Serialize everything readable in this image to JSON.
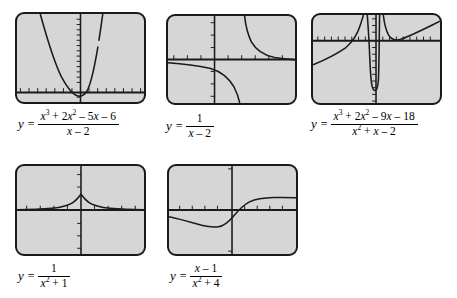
{
  "figure": {
    "kind": "graphing-calculator-screens-figure",
    "background_color": "#ffffff",
    "screen_fill": "#d6d6d6",
    "curve_color": "#1a1a1a",
    "axis_color": "#1a1a1a",
    "panel_count": 5
  },
  "panels": [
    {
      "id": "panel-1",
      "equation_text": "y = (x^3 + 2x^2 - 5x - 6)/(x - 2)",
      "numerator": {
        "parts": [
          {
            "t": "x",
            "italic": true
          },
          {
            "t": "3",
            "sup": true
          },
          {
            "t": " + 2"
          },
          {
            "t": "x",
            "italic": true
          },
          {
            "t": "2",
            "sup": true
          },
          {
            "t": " – 5"
          },
          {
            "t": "x",
            "italic": true
          },
          {
            "t": " – 6"
          }
        ],
        "plain": "x3 + 2x2 – 5x – 6"
      },
      "denominator": {
        "plain": "x – 2"
      },
      "y_label": "y",
      "equals": "=",
      "chart": {
        "type": "line",
        "function": "(x^3 + 2x^2 - 5x - 6)/(x - 2)",
        "hole_at_x": 3,
        "xlim": [
          -9.4,
          9.4
        ],
        "ylim": [
          -3.1,
          28
        ],
        "x_tick_step": 1,
        "y_tick_step": 2,
        "grid": false,
        "axis_x_position_frac": 0.895,
        "axis_y_position_frac": 0.5
      }
    },
    {
      "id": "panel-2",
      "equation_text": "y = 1/(x - 2)",
      "numerator": {
        "plain": "1"
      },
      "denominator": {
        "plain": "x – 2"
      },
      "y_label": "y",
      "equals": "=",
      "chart": {
        "type": "line",
        "function": "1/(x - 2)",
        "vertical_asymptotes": [
          2
        ],
        "horizontal_asymptote": 0,
        "xlim": [
          -4.7,
          4.7
        ],
        "ylim": [
          -3.1,
          3.1
        ],
        "x_tick_step": 1,
        "y_tick_step": 1,
        "grid": false,
        "axis_x_position_frac": 0.5,
        "axis_y_position_frac": 0.5
      }
    },
    {
      "id": "panel-3",
      "equation_text": "y = (x^3 + 2x^2 - 9x - 18)/(x^2 + x - 2)",
      "numerator": {
        "plain": "x3 + 2x2 – 9x – 18"
      },
      "denominator": {
        "plain": "x2 + x – 2"
      },
      "y_label": "y",
      "equals": "=",
      "chart": {
        "type": "line",
        "function": "(x^3 + 2x^2 - 9x - 18)/(x^2 + x - 2)",
        "vertical_asymptotes": [
          -2,
          1
        ],
        "slant_asymptote": "y = x + 1",
        "xlim": [
          -9.4,
          9.4
        ],
        "ylim": [
          -18,
          10
        ],
        "x_tick_step": 1,
        "y_tick_step": 1,
        "grid": false,
        "axis_x_position_frac": 0.29,
        "axis_y_position_frac": 0.5
      }
    },
    {
      "id": "panel-4",
      "equation_text": "y = 1/(x^2 + 1)",
      "numerator": {
        "plain": "1"
      },
      "denominator": {
        "plain": "x2 + 1"
      },
      "y_label": "y",
      "equals": "=",
      "chart": {
        "type": "line",
        "function": "1/(x^2 + 1)",
        "maximum": {
          "x": 0,
          "y": 1
        },
        "horizontal_asymptote": 0,
        "xlim": [
          -9.4,
          9.4
        ],
        "ylim": [
          -3.1,
          3.1
        ],
        "x_tick_step": 1,
        "y_tick_step": 1,
        "grid": false,
        "axis_x_position_frac": 0.5,
        "axis_y_position_frac": 0.5
      }
    },
    {
      "id": "panel-5",
      "equation_text": "y = (x - 1)/(x^2 + 4)",
      "numerator": {
        "plain": "x – 1"
      },
      "denominator": {
        "plain": "x2 + 4"
      },
      "y_label": "y",
      "equals": "=",
      "chart": {
        "type": "line",
        "function": "(x - 1)/(x^2 + 4)",
        "x_intercept": 1,
        "horizontal_asymptote": 0,
        "xlim": [
          -9.4,
          9.4
        ],
        "ylim": [
          -0.55,
          0.55
        ],
        "x_tick_step": 1,
        "y_tick_step": 0.25,
        "grid": false,
        "axis_x_position_frac": 0.5,
        "axis_y_position_frac": 0.5
      }
    }
  ]
}
